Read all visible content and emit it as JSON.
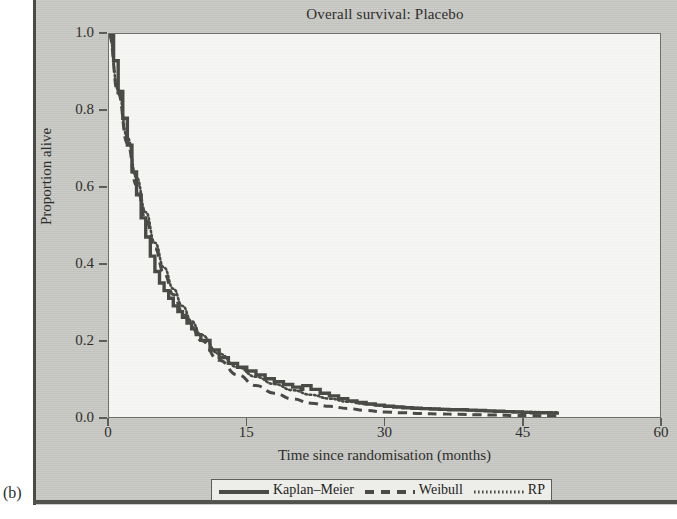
{
  "figure": {
    "panel_letter": "(b)",
    "background_color": "#c9c9c5",
    "plot_background_color": "#f5f5f3",
    "line_color": "#4a4a47"
  },
  "chart_data": {
    "type": "line",
    "title": "Overall survival: Placebo",
    "xlabel": "Time since randomisation (months)",
    "ylabel": "Proportion alive",
    "xlim": [
      0,
      60
    ],
    "ylim": [
      0.0,
      1.0
    ],
    "xticks": [
      0,
      15,
      30,
      45,
      60
    ],
    "xtick_labels": [
      "0",
      "15",
      "30",
      "45",
      "60"
    ],
    "yticks": [
      0.0,
      0.2,
      0.4,
      0.6,
      0.8,
      1.0
    ],
    "ytick_labels": [
      "0.0",
      "0.2",
      "0.4",
      "0.6",
      "0.8",
      "1.0"
    ],
    "grid": false,
    "legend_position": "below-axis-center",
    "series": [
      {
        "name": "Kaplan-Meier",
        "style": "solid",
        "x": [
          0,
          0.5,
          1,
          1.5,
          2,
          2.5,
          3,
          3.5,
          4,
          4.5,
          5,
          5.5,
          6,
          6.5,
          7,
          7.5,
          8,
          8.5,
          9,
          9.5,
          10,
          11,
          12,
          13,
          14,
          15,
          16,
          17,
          18,
          19,
          20,
          20.9,
          21.1,
          22,
          23,
          24,
          25,
          26,
          27,
          28,
          29,
          30,
          31,
          32,
          33,
          34,
          35,
          36,
          37,
          38,
          39,
          40,
          41,
          42,
          43,
          44,
          45,
          46,
          47,
          48,
          49
        ],
        "y": [
          1.0,
          0.93,
          0.85,
          0.78,
          0.71,
          0.64,
          0.58,
          0.52,
          0.47,
          0.42,
          0.38,
          0.35,
          0.33,
          0.31,
          0.29,
          0.275,
          0.26,
          0.245,
          0.23,
          0.215,
          0.2,
          0.175,
          0.155,
          0.14,
          0.13,
          0.12,
          0.11,
          0.1,
          0.092,
          0.085,
          0.078,
          0.072,
          0.082,
          0.072,
          0.062,
          0.055,
          0.048,
          0.042,
          0.038,
          0.034,
          0.031,
          0.028,
          0.026,
          0.024,
          0.023,
          0.022,
          0.021,
          0.02,
          0.019,
          0.019,
          0.018,
          0.017,
          0.016,
          0.015,
          0.014,
          0.013,
          0.012,
          0.011,
          0.011,
          0.01,
          0.01
        ]
      },
      {
        "name": "Weibull",
        "style": "dashed",
        "x": [
          0,
          1,
          2,
          3,
          4,
          5,
          6,
          7,
          8,
          9,
          10,
          12,
          14,
          16,
          18,
          20,
          22,
          24,
          26,
          28,
          30,
          32,
          34,
          36,
          38,
          40,
          42,
          44,
          46,
          48,
          49
        ],
        "y": [
          1.0,
          0.845,
          0.715,
          0.605,
          0.515,
          0.44,
          0.375,
          0.32,
          0.275,
          0.235,
          0.2,
          0.148,
          0.11,
          0.082,
          0.062,
          0.047,
          0.036,
          0.028,
          0.022,
          0.017,
          0.013,
          0.011,
          0.009,
          0.008,
          0.007,
          0.006,
          0.005,
          0.004,
          0.004,
          0.003,
          0.003
        ]
      },
      {
        "name": "RP",
        "style": "dotted",
        "x": [
          0,
          1,
          2,
          3,
          4,
          5,
          6,
          7,
          8,
          9,
          10,
          12,
          14,
          16,
          18,
          20,
          22,
          24,
          26,
          28,
          30,
          32,
          34,
          36,
          38,
          40,
          42,
          44,
          46,
          48,
          49
        ],
        "y": [
          1.0,
          0.855,
          0.73,
          0.625,
          0.535,
          0.455,
          0.39,
          0.335,
          0.29,
          0.25,
          0.215,
          0.165,
          0.13,
          0.105,
          0.086,
          0.07,
          0.058,
          0.048,
          0.04,
          0.034,
          0.029,
          0.026,
          0.023,
          0.021,
          0.019,
          0.017,
          0.015,
          0.014,
          0.013,
          0.012,
          0.012
        ]
      }
    ]
  }
}
